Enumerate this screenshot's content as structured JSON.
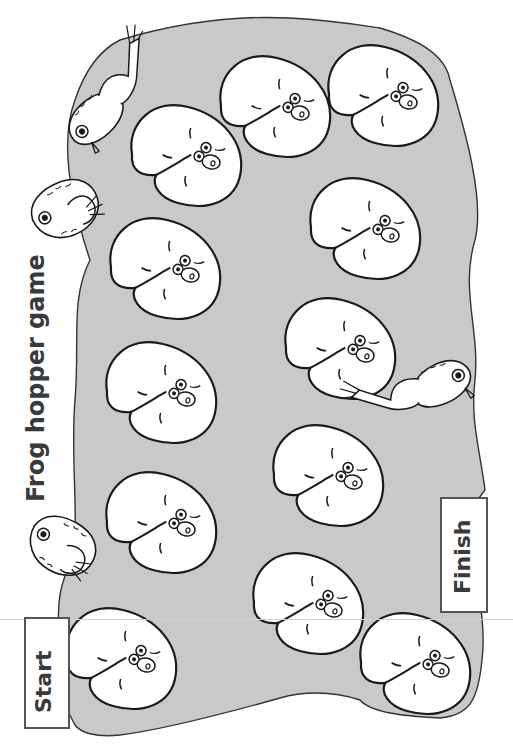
{
  "game": {
    "title": "Frog hopper game",
    "start_label": "Start",
    "finish_label": "Finish",
    "colors": {
      "pond": "#c9c9c9",
      "outline": "#1a1a1a",
      "pad": "#ffffff",
      "label_text": "#3a3a3a"
    },
    "path": {
      "lily_pad_count": 12,
      "pads": [
        {
          "index": 1,
          "role": "start"
        },
        {
          "index": 2,
          "role": "space"
        },
        {
          "index": 3,
          "role": "space"
        },
        {
          "index": 4,
          "role": "space"
        },
        {
          "index": 5,
          "role": "space"
        },
        {
          "index": 6,
          "role": "space"
        },
        {
          "index": 7,
          "role": "space"
        },
        {
          "index": 8,
          "role": "space"
        },
        {
          "index": 9,
          "role": "space"
        },
        {
          "index": 10,
          "role": "space"
        },
        {
          "index": 11,
          "role": "space"
        },
        {
          "index": 12,
          "role": "finish"
        }
      ]
    },
    "frogs": [
      {
        "name": "leaping-frog-top",
        "pose": "leaping"
      },
      {
        "name": "sitting-frog-left-upper",
        "pose": "sitting"
      },
      {
        "name": "sitting-frog-left-lower",
        "pose": "sitting"
      },
      {
        "name": "leaping-frog-right",
        "pose": "leaping"
      }
    ]
  }
}
